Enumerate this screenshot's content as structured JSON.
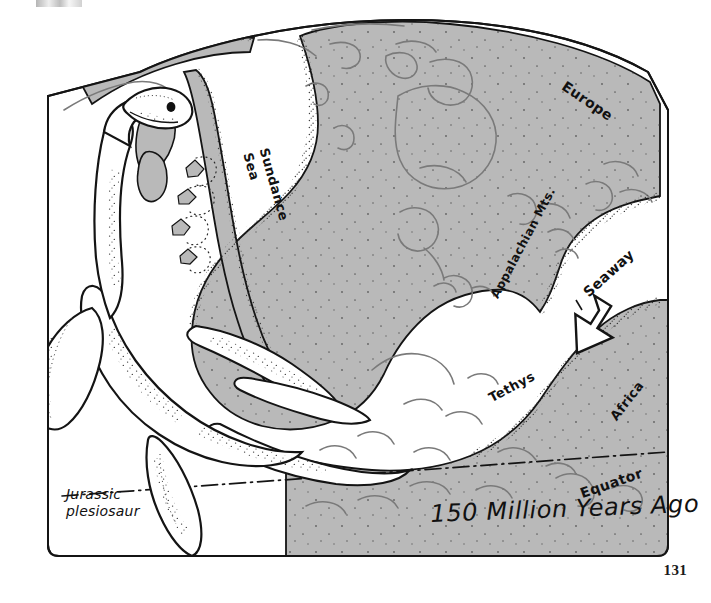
{
  "page": {
    "number": "131",
    "background_color": "#ffffff"
  },
  "figure": {
    "title": "150 Million Years Ago",
    "creature_caption_line1": "Jurassic",
    "creature_caption_line2": "plesiosaur",
    "land_fill_color": "#b9b9b9",
    "ocean_fill_color": "#ffffff",
    "ink_color": "#141414",
    "coastline_color": "#6b6b6b"
  },
  "map_labels": [
    {
      "name": "sundance-sea",
      "text": "Sundance\nSea",
      "line1": "Sundance",
      "line2": "Sea"
    },
    {
      "name": "europe",
      "text": "Europe"
    },
    {
      "name": "appalachian-mts",
      "text": "Appalachian Mts."
    },
    {
      "name": "seaway",
      "text": "Seaway"
    },
    {
      "name": "tethys",
      "text": "Tethys"
    },
    {
      "name": "africa",
      "text": "Africa"
    },
    {
      "name": "equator",
      "text": "Equator"
    }
  ],
  "annotations": {
    "seaway_arrow": "large outlined white arrow pointing down-right into the seaway",
    "equator_line": "dash-dot line crossing the lower right of the map"
  }
}
